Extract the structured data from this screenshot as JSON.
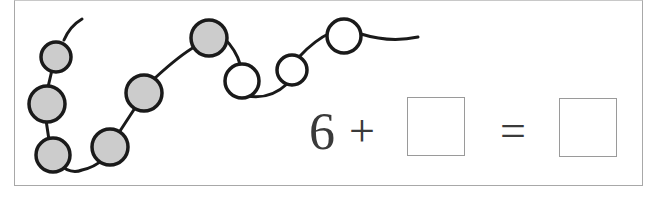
{
  "exercise": {
    "type": "bead-string-addition",
    "beads": {
      "total": 9,
      "shaded_count": 6,
      "unshaded_count": 3,
      "shaded_color": "#cccccc",
      "unshaded_color": "#ffffff",
      "outline_color": "#1a1a1a",
      "items": [
        {
          "index": 1,
          "shaded": true
        },
        {
          "index": 2,
          "shaded": true
        },
        {
          "index": 3,
          "shaded": true
        },
        {
          "index": 4,
          "shaded": true
        },
        {
          "index": 5,
          "shaded": true
        },
        {
          "index": 6,
          "shaded": true
        },
        {
          "index": 7,
          "shaded": false
        },
        {
          "index": 8,
          "shaded": false
        },
        {
          "index": 9,
          "shaded": false
        }
      ]
    },
    "equation": {
      "first_addend": "6",
      "plus_sign": "+",
      "second_addend_box": "",
      "equals_sign": "=",
      "sum_box": ""
    }
  }
}
